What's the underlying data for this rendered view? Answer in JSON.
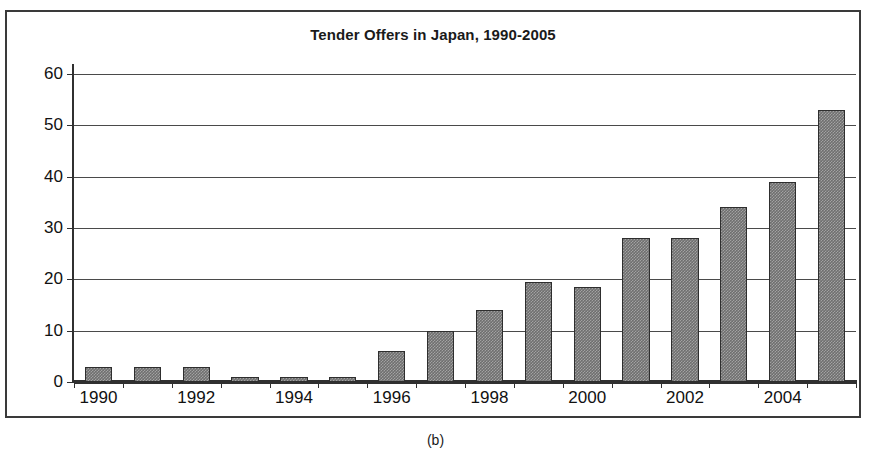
{
  "figure": {
    "caption": "(b)"
  },
  "chart_data": {
    "type": "bar",
    "title": "Tender Offers in Japan, 1990-2005",
    "xlabel": "",
    "ylabel": "",
    "ylim": [
      0,
      60
    ],
    "ytick_values": [
      0,
      10,
      20,
      30,
      40,
      50,
      60
    ],
    "ytick_labels": [
      "0",
      "10",
      "20",
      "30",
      "40",
      "50",
      "60"
    ],
    "grid": true,
    "legend": "none",
    "categories": [
      "1990",
      "1991",
      "1992",
      "1993",
      "1994",
      "1995",
      "1996",
      "1997",
      "1998",
      "1999",
      "2000",
      "2001",
      "2002",
      "2003",
      "2004",
      "2005"
    ],
    "xtick_labels_shown": [
      "1990",
      "1992",
      "1994",
      "1996",
      "1998",
      "2000",
      "2002",
      "2004"
    ],
    "values": [
      3,
      3,
      3,
      1,
      1,
      1,
      6,
      10,
      14,
      19.5,
      18.5,
      28,
      28,
      34,
      39,
      53
    ],
    "bar_color": "#6f6f6f",
    "bar_edge_color": "#2e2e2e",
    "axis_color": "#303030",
    "background": "#ffffff"
  }
}
